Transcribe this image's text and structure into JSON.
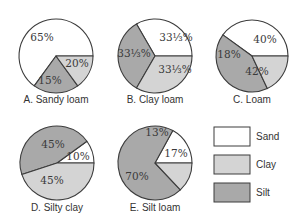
{
  "chart_data": {
    "type": "pie",
    "title": "",
    "categories": [
      "Sand",
      "Clay",
      "Silt"
    ],
    "colors": {
      "Sand": "#ffffff",
      "Clay": "#d4d4d4",
      "Silt": "#a9a9a9"
    },
    "stroke": "#3c3c3c",
    "legend": {
      "position": "bottom-right",
      "entries": [
        {
          "label": "Sand",
          "color": "#ffffff"
        },
        {
          "label": "Clay",
          "color": "#d4d4d4"
        },
        {
          "label": "Silt",
          "color": "#a9a9a9"
        }
      ]
    },
    "pies": [
      {
        "id": "A",
        "label": "A. Sandy loam",
        "cx": 56,
        "cy": 56,
        "r": 37,
        "slices": [
          {
            "category": "Sand",
            "value": 65,
            "text": "65%",
            "start": 0,
            "tx": 42,
            "ty": 41
          },
          {
            "category": "Silt",
            "value": 20,
            "text": "20%",
            "start": 234,
            "tx": 77,
            "ty": 67
          },
          {
            "category": "Clay",
            "value": 15,
            "text": "15%",
            "start": 306,
            "tx": 50,
            "ty": 84
          }
        ]
      },
      {
        "id": "B",
        "label": "B. Clay loam",
        "cx": 155,
        "cy": 56,
        "r": 37,
        "slices": [
          {
            "category": "Sand",
            "value": 33.33,
            "text": "33⅓%",
            "start": 0,
            "tx": 176,
            "ty": 41
          },
          {
            "category": "Silt",
            "value": 33.33,
            "text": "33⅓%",
            "start": 120,
            "tx": 175,
            "ty": 73
          },
          {
            "category": "Clay",
            "value": 33.33,
            "text": "33⅓%",
            "start": 240,
            "tx": 134,
            "ty": 57
          }
        ]
      },
      {
        "id": "C",
        "label": "C. Loam",
        "cx": 252,
        "cy": 56,
        "r": 36,
        "slices": [
          {
            "category": "Sand",
            "value": 40,
            "text": "40%",
            "start": 0,
            "tx": 265,
            "ty": 43
          },
          {
            "category": "Silt",
            "value": 42,
            "text": "42%",
            "start": 144,
            "tx": 257,
            "ty": 75
          },
          {
            "category": "Clay",
            "value": 18,
            "text": "18%",
            "start": 295.2,
            "tx": 229,
            "ty": 58
          }
        ]
      },
      {
        "id": "D",
        "label": "D. Silty clay",
        "cx": 57,
        "cy": 163,
        "r": 37,
        "slices": [
          {
            "category": "Sand",
            "value": 10,
            "text": "10%",
            "start": 0,
            "tx": 78,
            "ty": 160
          },
          {
            "category": "Silt",
            "value": 45,
            "text": "45%",
            "start": 36,
            "tx": 52,
            "ty": 184
          },
          {
            "category": "Clay",
            "value": 45,
            "text": "45%",
            "start": 198,
            "tx": 53,
            "ty": 148
          }
        ]
      },
      {
        "id": "E",
        "label": "E. Silt loam",
        "cx": 155,
        "cy": 163,
        "r": 37,
        "slices": [
          {
            "category": "Sand",
            "value": 17,
            "text": "17%",
            "start": 0,
            "tx": 176,
            "ty": 157
          },
          {
            "category": "Silt",
            "value": 70,
            "text": "70%",
            "start": 61.2,
            "tx": 137,
            "ty": 180
          },
          {
            "category": "Clay",
            "value": 13,
            "text": "13%",
            "start": 313.2,
            "tx": 157,
            "ty": 136
          }
        ]
      }
    ]
  },
  "legend_layout": {
    "box_x": 214,
    "box_w": 36,
    "box_h": 19,
    "rows_y": [
      127,
      155,
      183
    ],
    "label_x": 256
  },
  "pie_label_y": {
    "top_row": 103,
    "bottom_row": 211
  }
}
